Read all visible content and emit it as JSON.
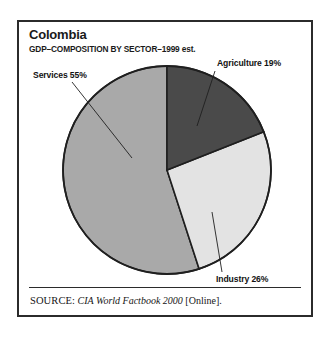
{
  "figure": {
    "title": "Colombia",
    "subtitle": "GDP–COMPOSITION BY SECTOR–1999 est.",
    "source": {
      "label": "SOURCE:",
      "work": " CIA World Factbook 2000",
      "medium": " [Online]."
    },
    "border_color": "#2b2b2b",
    "background_color": "#ffffff"
  },
  "chart_data": {
    "type": "pie",
    "title": "Colombia",
    "subtitle": "GDP–COMPOSITION BY SECTOR–1999 est.",
    "xlabel": "",
    "ylabel": "",
    "grid": false,
    "legend_position": "callout-labels",
    "start_angle_deg": 0,
    "direction": "clockwise",
    "units": "percent",
    "categories": [
      "Agriculture",
      "Industry",
      "Services"
    ],
    "values": [
      19,
      26,
      55
    ],
    "labels": [
      "Agriculture 19%",
      "Industry 26%",
      "Services 55%"
    ],
    "colors": [
      "#4a4a4a",
      "#e3e3e3",
      "#a9a9a9"
    ],
    "slices": [
      {
        "name": "Agriculture",
        "value": 19,
        "label": "Agriculture 19%",
        "color": "#4a4a4a",
        "start_deg": 0,
        "end_deg": 68.4
      },
      {
        "name": "Industry",
        "value": 26,
        "label": "Industry 26%",
        "color": "#e3e3e3",
        "start_deg": 68.4,
        "end_deg": 162.0
      },
      {
        "name": "Services",
        "value": 55,
        "label": "Services 55%",
        "color": "#a9a9a9",
        "start_deg": 162.0,
        "end_deg": 360.0
      }
    ],
    "total": 100
  }
}
